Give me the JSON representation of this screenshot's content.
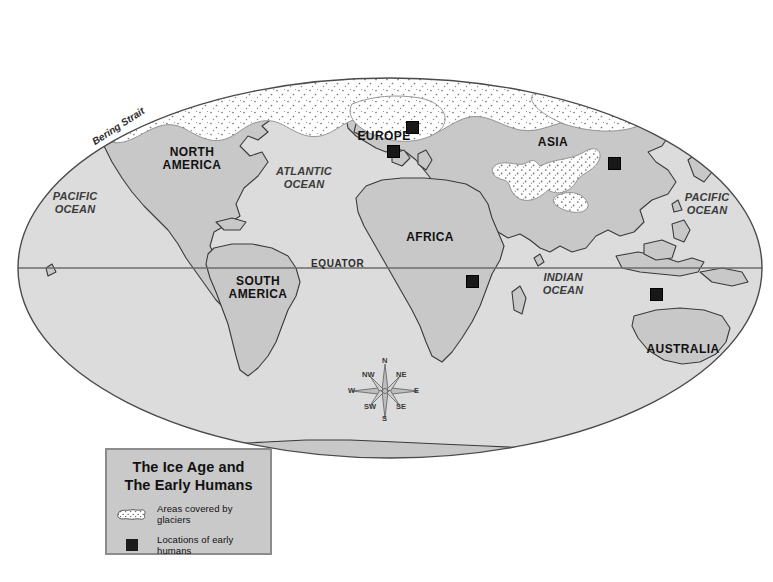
{
  "map": {
    "projection": "elliptical world map",
    "equator_label": "EQUATOR",
    "colors": {
      "land": "#c8c8c8",
      "ocean": "#dcdcdc",
      "glacier": "#ffffff",
      "coastline": "#3a3a3a",
      "marker": "#181818",
      "legend_fill": "#c9c9c9",
      "legend_border": "#8c8c8c",
      "page_background": "#ffffff"
    },
    "continent_labels": [
      {
        "name": "north-america",
        "text": "NORTH\nAMERICA",
        "x": 192,
        "y": 152
      },
      {
        "name": "south-america",
        "text": "SOUTH\nAMERICA",
        "x": 258,
        "y": 281
      },
      {
        "name": "europe",
        "text": "EUROPE",
        "x": 384,
        "y": 130
      },
      {
        "name": "africa",
        "text": "AFRICA",
        "x": 430,
        "y": 231
      },
      {
        "name": "asia",
        "text": "ASIA",
        "x": 553,
        "y": 137
      },
      {
        "name": "australia",
        "text": "AUSTRALIA",
        "x": 683,
        "y": 347
      }
    ],
    "ocean_labels": [
      {
        "name": "pacific-ocean-west",
        "text": "PACIFIC\nOCEAN",
        "x": 72,
        "y": 196
      },
      {
        "name": "atlantic-ocean",
        "text": "ATLANTIC\nOCEAN",
        "x": 302,
        "y": 171
      },
      {
        "name": "indian-ocean",
        "text": "INDIAN\nOCEAN",
        "x": 563,
        "y": 276
      },
      {
        "name": "pacific-ocean-east",
        "text": "PACIFIC\nOCEAN",
        "x": 706,
        "y": 197
      }
    ],
    "strait_label": {
      "name": "bering-strait",
      "text": "Bering Strait",
      "x": 96,
      "y": 130,
      "rotation": -33
    },
    "early_human_sites": [
      {
        "name": "site-europe-north",
        "x": 406,
        "y": 121
      },
      {
        "name": "site-europe-south",
        "x": 387,
        "y": 145
      },
      {
        "name": "site-asia-east",
        "x": 608,
        "y": 157
      },
      {
        "name": "site-africa-east",
        "x": 466,
        "y": 275
      },
      {
        "name": "site-southeast-asia",
        "x": 650,
        "y": 288
      }
    ],
    "glacier_regions": [
      "Arctic / northern North America",
      "Northern Europe and Scandinavia",
      "Northern Asia / Siberia",
      "Himalaya and Tibetan plateau"
    ]
  },
  "compass": {
    "directions": [
      {
        "name": "north",
        "label": "N"
      },
      {
        "name": "northeast",
        "label": "NE"
      },
      {
        "name": "east",
        "label": "E"
      },
      {
        "name": "southeast",
        "label": "SE"
      },
      {
        "name": "south",
        "label": "S"
      },
      {
        "name": "southwest",
        "label": "SW"
      },
      {
        "name": "west",
        "label": "W"
      },
      {
        "name": "northwest",
        "label": "NW"
      }
    ]
  },
  "legend": {
    "title_line1": "The Ice Age and",
    "title_line2": "The Early Humans",
    "items": [
      {
        "name": "glaciers",
        "label": "Areas covered by glaciers",
        "symbol": "glacier-patch-icon"
      },
      {
        "name": "early-humans",
        "label": "Locations of early humans",
        "symbol": "black-square-icon"
      }
    ]
  }
}
